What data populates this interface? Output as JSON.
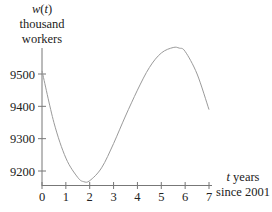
{
  "chart_data": {
    "type": "line",
    "title": "",
    "ylabel_lines": [
      "w(t)",
      "thousand",
      "workers"
    ],
    "ylabel_var": "w",
    "ylabel_arg": "t",
    "xlabel_var": "t",
    "xlabel_lines": [
      "t years",
      "since 2001"
    ],
    "xlabel_rest": " years",
    "xlabel_line2": "since 2001",
    "x_ticks": [
      0,
      1,
      2,
      3,
      4,
      5,
      6,
      7
    ],
    "y_ticks": [
      9200,
      9300,
      9400,
      9500
    ],
    "xlim": [
      0,
      7
    ],
    "ylim": [
      9150,
      9620
    ],
    "grid": false,
    "legend": "none",
    "series": [
      {
        "name": "w(t)",
        "color": "#9a9a9a",
        "x": [
          0,
          0.5,
          1,
          1.5,
          1.75,
          2,
          2.5,
          3,
          3.5,
          4,
          4.5,
          5,
          5.5,
          5.75,
          6,
          6.5,
          7
        ],
        "y": [
          9510,
          9350,
          9240,
          9180,
          9167,
          9170,
          9210,
          9285,
          9370,
          9450,
          9520,
          9565,
          9582,
          9580,
          9570,
          9500,
          9390
        ]
      }
    ],
    "key_points": {
      "start": {
        "t": 0,
        "w": 9510
      },
      "minimum": {
        "t": 1.75,
        "w": 9167
      },
      "maximum": {
        "t": 5.7,
        "w": 9582
      },
      "end": {
        "t": 7,
        "w": 9390
      }
    }
  },
  "axis": {
    "y_label_line1_var": "w",
    "y_label_line1_paren_open": "(",
    "y_label_line1_arg": "t",
    "y_label_line1_paren_close": ")",
    "y_label_line2": "thousand",
    "y_label_line3": "workers",
    "x_label_var": "t",
    "x_label_rest": " years",
    "x_label_line2": "since 2001",
    "y_tick_labels": [
      "9500",
      "9400",
      "9300",
      "9200"
    ],
    "x_tick_labels": [
      "0",
      "1",
      "2",
      "3",
      "4",
      "5",
      "6",
      "7"
    ]
  }
}
